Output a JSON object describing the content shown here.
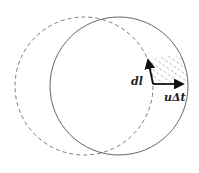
{
  "diagram": {
    "circles": [
      {
        "name": "original-circle",
        "style": "dashed",
        "cx": 84,
        "cy": 86,
        "r": 69,
        "color": "#777777"
      },
      {
        "name": "displaced-circle",
        "style": "solid",
        "cx": 119,
        "cy": 86,
        "r": 69,
        "color": "#666666"
      }
    ],
    "vectors": [
      {
        "name": "dl-vector",
        "label": "dl",
        "from": [
          153,
          84
        ],
        "to": [
          147,
          57
        ]
      },
      {
        "name": "u-delta-t-vector",
        "label": "uΔt",
        "from": [
          153,
          84
        ],
        "to": [
          187,
          84
        ]
      }
    ],
    "labels": {
      "dl": "dl",
      "u_delta_t": "uΔt"
    },
    "hatched_region": {
      "description": "Area swept by element dl moving a distance uΔt",
      "color": "#666666"
    }
  }
}
